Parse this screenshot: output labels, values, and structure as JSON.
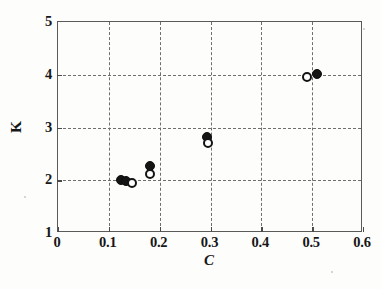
{
  "chart_data": {
    "type": "scatter",
    "title": "",
    "subtitle": "",
    "xlabel": "C",
    "ylabel": "K",
    "xlim": [
      0,
      0.6
    ],
    "ylim": [
      1,
      5
    ],
    "xticks": [
      0,
      0.1,
      0.2,
      0.3,
      0.4,
      0.5,
      0.6
    ],
    "yticks": [
      1,
      2,
      3,
      4,
      5
    ],
    "xtick_labels": [
      "0",
      "0.1",
      "0.2",
      "0.3",
      "0.4",
      "0.5",
      "0.6"
    ],
    "ytick_labels": [
      "1",
      "2",
      "3",
      "4",
      "5"
    ],
    "grid": true,
    "grid_style": "dashed",
    "legend": false,
    "legend_position": "none",
    "series": [
      {
        "name": "filled-circles",
        "marker": "filled circle",
        "color": "#151515",
        "points": [
          {
            "x": 0.125,
            "y": 1.98
          },
          {
            "x": 0.135,
            "y": 1.97
          },
          {
            "x": 0.182,
            "y": 2.26
          },
          {
            "x": 0.296,
            "y": 2.8
          },
          {
            "x": 0.512,
            "y": 4.0
          }
        ]
      },
      {
        "name": "open-circles",
        "marker": "open circle",
        "color": "#141414",
        "points": [
          {
            "x": 0.147,
            "y": 1.93
          },
          {
            "x": 0.183,
            "y": 2.1
          },
          {
            "x": 0.297,
            "y": 2.68
          },
          {
            "x": 0.492,
            "y": 3.93
          }
        ]
      }
    ]
  },
  "axis": {
    "x_title": "C",
    "y_title": "K"
  }
}
